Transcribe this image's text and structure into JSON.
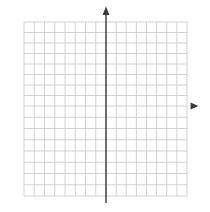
{
  "chart_data": {
    "type": "grid",
    "title": "",
    "xlabel": "",
    "ylabel": "",
    "x_range": [
      -8,
      8
    ],
    "y_range": [
      -8,
      8
    ],
    "x_cells": 16,
    "y_cells": 16,
    "grid": true,
    "tick_labels": "none",
    "series": [],
    "axes": {
      "origin": [
        0,
        0
      ],
      "y_arrow": "up",
      "x_arrow": "right"
    },
    "colors": {
      "background": "#ffffff",
      "grid": "#cdcdcd",
      "axis": "#3a3a3a",
      "x_axis_left": "#a3a3a3",
      "x_axis_right": "#4a4a4a"
    }
  }
}
